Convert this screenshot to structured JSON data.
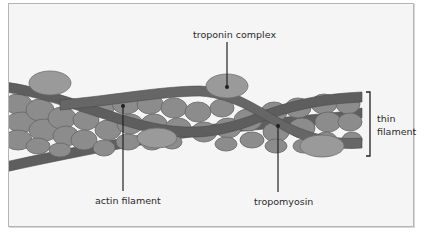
{
  "diagram": {
    "colors": {
      "background": "#f5f5f5",
      "frame_border": "#b5b5b5",
      "actin_fill": "#8c8c8c",
      "actin_stroke": "#6a6a6a",
      "troponin_fill": "#9a9a9a",
      "tropomyosin": "#5e5e5e",
      "leader_line": "#222222"
    },
    "labels": {
      "troponin": "troponin complex",
      "actin": "actin filament",
      "tropomyosin": "tropomyosin",
      "thin_line1": "thin",
      "thin_line2": "filament"
    }
  }
}
